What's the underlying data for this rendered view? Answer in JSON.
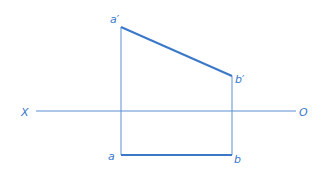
{
  "diagram": {
    "type": "orthographic-projection-of-line-segment",
    "colors": {
      "stroke": "#3a78c8",
      "axis": "#5a8fd0",
      "background": "#ffffff"
    },
    "axis": {
      "left_label": "X",
      "right_label": "O"
    },
    "points": {
      "a_prime": {
        "label": "a′"
      },
      "b_prime": {
        "label": "b′"
      },
      "a": {
        "label": "a"
      },
      "b": {
        "label": "b"
      }
    }
  }
}
